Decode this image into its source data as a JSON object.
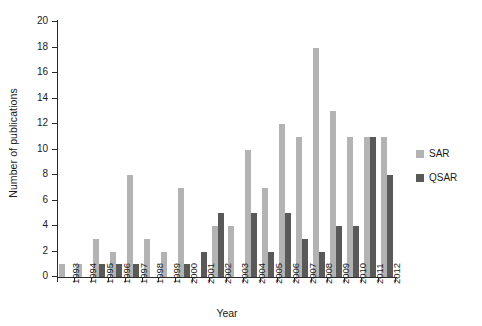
{
  "chart_data": {
    "type": "bar",
    "title": "",
    "subtitle": "",
    "xlabel": "Year",
    "ylabel": "Number of publications",
    "ylim": [
      0,
      20
    ],
    "ytick_step": 2,
    "yticks": [
      0,
      2,
      4,
      6,
      8,
      10,
      12,
      14,
      16,
      18,
      20
    ],
    "grid": false,
    "legend_position": "right",
    "categories": [
      "1993",
      "1994",
      "1995",
      "1996",
      "1997",
      "1998",
      "1999",
      "2000",
      "2001",
      "2002",
      "2003",
      "2004",
      "2005",
      "2006",
      "2007",
      "2008",
      "2009",
      "2010",
      "2011",
      "2012"
    ],
    "series": [
      {
        "name": "SAR",
        "color": "#b3b3b3",
        "values": [
          1,
          1,
          3,
          2,
          8,
          3,
          2,
          7,
          0,
          4,
          4,
          10,
          7,
          12,
          11,
          18,
          13,
          11,
          11,
          11
        ]
      },
      {
        "name": "QSAR",
        "color": "#595959",
        "values": [
          0,
          0,
          1,
          1,
          1,
          0,
          0,
          1,
          2,
          5,
          0,
          5,
          2,
          5,
          3,
          2,
          4,
          4,
          11,
          8
        ]
      }
    ]
  },
  "axes": {
    "y_title": "Number of publications",
    "x_title": "Year"
  },
  "legend": {
    "items": [
      {
        "label": "SAR",
        "color": "#b3b3b3"
      },
      {
        "label": "QSAR",
        "color": "#595959"
      }
    ]
  }
}
